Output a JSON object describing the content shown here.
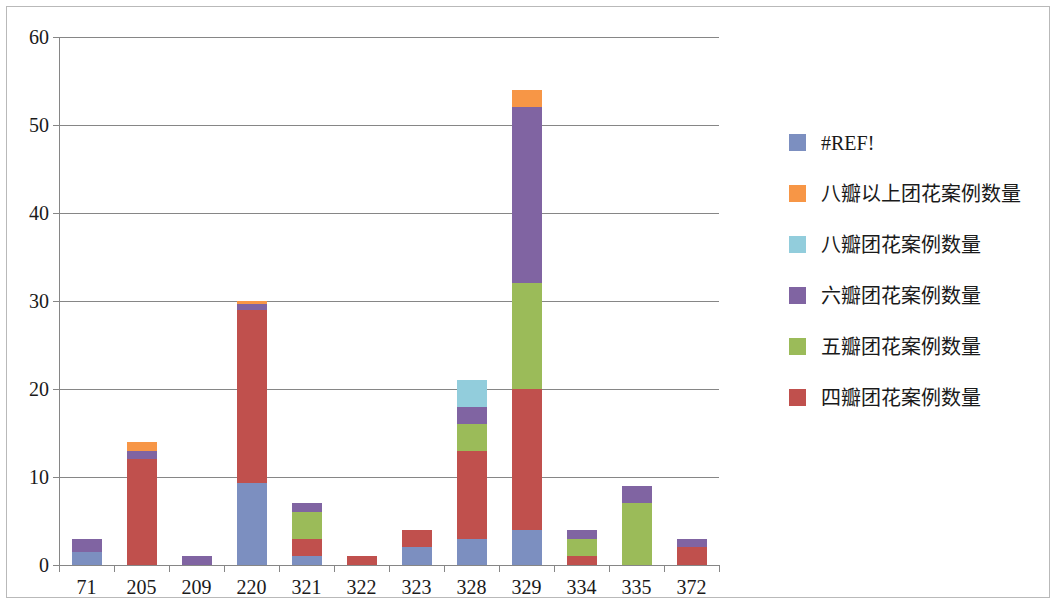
{
  "chart_data": {
    "type": "bar",
    "subtype": "stacked",
    "title": "",
    "xlabel": "",
    "ylabel": "",
    "ylim": [
      0,
      60
    ],
    "ytick_step": 10,
    "yticks": [
      "0",
      "10",
      "20",
      "30",
      "40",
      "50",
      "60"
    ],
    "grid": true,
    "legend_position": "right",
    "categories": [
      "71",
      "205",
      "209",
      "220",
      "321",
      "322",
      "323",
      "328",
      "329",
      "334",
      "335",
      "372"
    ],
    "series": [
      {
        "name": "#REF!",
        "color": "#7c8fc0",
        "values": [
          1.5,
          0,
          0,
          9.3,
          1,
          0,
          2,
          3,
          4,
          0,
          0,
          0
        ]
      },
      {
        "name": "四瓣团花案例数量",
        "color": "#c0504d",
        "values": [
          0,
          12,
          0,
          19.7,
          2,
          1,
          2,
          10,
          16,
          1,
          0,
          2
        ]
      },
      {
        "name": "五瓣团花案例数量",
        "color": "#9bbb59",
        "values": [
          0,
          0,
          0,
          0,
          3,
          0,
          0,
          3,
          12,
          2,
          7,
          0
        ]
      },
      {
        "name": "六瓣团花案例数量",
        "color": "#8064a2",
        "values": [
          1.5,
          1,
          1,
          0.7,
          1,
          0,
          0,
          2,
          20,
          1,
          2,
          1
        ]
      },
      {
        "name": "八瓣团花案例数量",
        "color": "#92cddc",
        "values": [
          0,
          0,
          0,
          0,
          0,
          0,
          0,
          3,
          0,
          0,
          0,
          0
        ]
      },
      {
        "name": "八瓣以上团花案例数量",
        "color": "#f79646",
        "values": [
          0,
          1,
          0,
          0.3,
          0,
          0,
          0,
          0,
          2,
          0,
          0,
          0
        ]
      }
    ],
    "stack_order_bottom_to_top": [
      "#REF!",
      "四瓣团花案例数量",
      "五瓣团花案例数量",
      "六瓣团花案例数量",
      "八瓣团花案例数量",
      "八瓣以上团花案例数量"
    ],
    "totals": [
      3,
      14,
      1,
      30,
      7,
      1,
      4,
      21,
      54,
      4,
      9,
      3
    ]
  },
  "legend": {
    "entries": [
      {
        "label": "#REF!",
        "color": "#7c8fc0"
      },
      {
        "label": "八瓣以上团花案例数量",
        "color": "#f79646"
      },
      {
        "label": "八瓣团花案例数量",
        "color": "#92cddc"
      },
      {
        "label": "六瓣团花案例数量",
        "color": "#8064a2"
      },
      {
        "label": "五瓣团花案例数量",
        "color": "#9bbb59"
      },
      {
        "label": "四瓣团花案例数量",
        "color": "#c0504d"
      }
    ]
  },
  "style": {
    "plot_background": "#ffffff",
    "grid_color": "#868686",
    "axis_color": "#868686",
    "border_color": "#b9b9b9",
    "text_color": "#1a1a1a"
  }
}
